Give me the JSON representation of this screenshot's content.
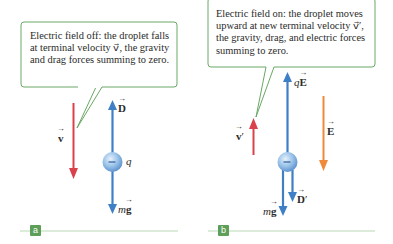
{
  "figure": {
    "panel_a": {
      "badge": "a",
      "callout": "Electric field off: the droplet falls at terminal velocity v⃗, the gravity and drag forces summing to zero.",
      "labels": {
        "drag": "D",
        "velocity": "v",
        "charge": "q",
        "weight_m": "m",
        "weight_g": "g",
        "droplet_sign": "−"
      }
    },
    "panel_b": {
      "badge": "b",
      "callout": "Electric field on: the droplet moves upward at new terminal velocity v⃗′, the gravity, drag, and electric forces summing to zero.",
      "labels": {
        "electric_force_q": "q",
        "electric_force_E": "E",
        "velocity": "v",
        "velocity_prime": "′",
        "field": "E",
        "drag": "D",
        "drag_prime": "′",
        "weight_m": "m",
        "weight_g": "g",
        "droplet_sign": "−"
      }
    },
    "colors": {
      "callout_border": "#6aa866",
      "velocity_arrow": "#d9424a",
      "force_arrow": "#3f7fc6",
      "field_arrow": "#ef8a3a",
      "badge": "#5d9e58",
      "baseline": "#b9d8b5"
    }
  }
}
